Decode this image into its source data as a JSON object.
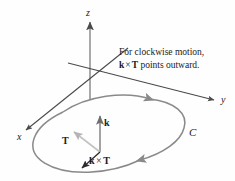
{
  "figure": {
    "title_note": {
      "line1": "For clockwise motion,",
      "line2_k": "k",
      "line2_times": "×",
      "line2_T": "T",
      "line2_rest": " points outward."
    },
    "axes": [
      {
        "name": "z-axis",
        "label": "z"
      },
      {
        "name": "y-axis",
        "label": "y"
      },
      {
        "name": "x-axis",
        "label": "x"
      }
    ],
    "vectors": [
      {
        "name": "k-vector",
        "label": "k",
        "color": "#6e6e6e"
      },
      {
        "name": "T-vector",
        "label": "T",
        "color": "#b5b5b5"
      },
      {
        "name": "k-cross-T-vector",
        "label_k": "k",
        "label_times": "×",
        "label_T": "T",
        "color": "#333333"
      }
    ],
    "curve": {
      "name": "oriented-curve",
      "label": "C",
      "color": "#8a8a8a",
      "orientation": "clockwise"
    },
    "colors": {
      "axis": "#4a4a4a",
      "curve": "#8a8a8a",
      "k_vector": "#6e6e6e",
      "T_vector": "#b5b5b5",
      "cross_vector": "#2b2b2b",
      "text": "#1a1a1a",
      "background": "#fefefe"
    }
  }
}
